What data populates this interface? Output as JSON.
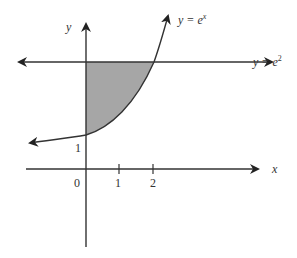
{
  "diagram": {
    "colors": {
      "stroke": "#333333",
      "shade": "#a6a6a6",
      "background": "#ffffff"
    },
    "axes": {
      "x_label": "x",
      "y_label": "y",
      "origin_label": "0",
      "x_ticks": [
        "1",
        "2"
      ],
      "y_ticks": [
        "1"
      ]
    },
    "curves": {
      "exp": {
        "label_prefix": "y = e",
        "label_exp": "x"
      },
      "line": {
        "label_prefix": "y = e",
        "label_exp": "2"
      }
    },
    "shaded_region": "Between y-axis (x=0), curve y=e^x and line y=e^2 for 0 ≤ x ≤ 2"
  }
}
